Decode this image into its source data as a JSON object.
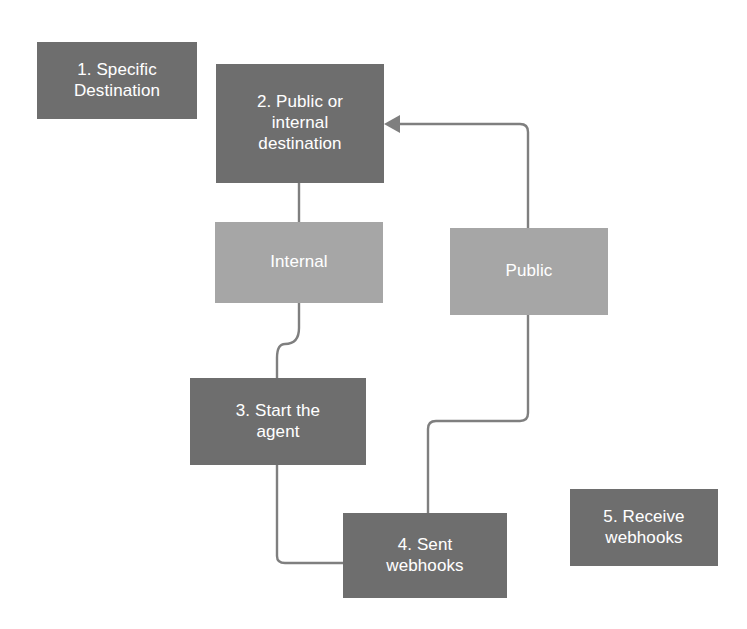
{
  "diagram": {
    "background_color": "#ffffff",
    "colors": {
      "node_dark": "#6e6e6e",
      "node_light": "#a6a6a6",
      "connector": "#7f7f7f",
      "node_text": "#ffffff"
    },
    "nodes": [
      {
        "id": "node-1",
        "label": "1. Specific\nDestination",
        "style": "dark",
        "x": 37,
        "y": 42,
        "w": 160,
        "h": 77,
        "font_size": 17
      },
      {
        "id": "node-2",
        "label": "2. Public or\ninternal\ndestination",
        "style": "dark",
        "x": 216,
        "y": 64,
        "w": 168,
        "h": 119,
        "font_size": 17
      },
      {
        "id": "node-internal",
        "label": "Internal",
        "style": "light",
        "x": 215,
        "y": 222,
        "w": 168,
        "h": 81,
        "font_size": 17
      },
      {
        "id": "node-public",
        "label": "Public",
        "style": "light",
        "x": 450,
        "y": 228,
        "w": 158,
        "h": 87,
        "font_size": 17
      },
      {
        "id": "node-3",
        "label": "3. Start the\nagent",
        "style": "dark",
        "x": 190,
        "y": 378,
        "w": 176,
        "h": 87,
        "font_size": 17
      },
      {
        "id": "node-4",
        "label": "4. Sent\nwebhooks",
        "style": "dark",
        "x": 343,
        "y": 513,
        "w": 164,
        "h": 85,
        "font_size": 17
      },
      {
        "id": "node-5",
        "label": "5. Receive\nwebhooks",
        "style": "dark",
        "x": 570,
        "y": 489,
        "w": 148,
        "h": 77,
        "font_size": 17
      }
    ],
    "connectors": [
      {
        "id": "conn-node2-internal",
        "from": "node-2",
        "to": "node-internal",
        "has_arrowhead": false
      },
      {
        "id": "conn-internal-node3",
        "from": "node-internal",
        "to": "node-3",
        "has_arrowhead": false
      },
      {
        "id": "conn-node3-node4",
        "from": "node-3",
        "to": "node-4",
        "has_arrowhead": false
      },
      {
        "id": "conn-public-node4",
        "from": "node-public",
        "to": "node-4",
        "has_arrowhead": false
      },
      {
        "id": "conn-public-node2",
        "from": "node-public",
        "to": "node-2",
        "has_arrowhead": true
      }
    ]
  }
}
